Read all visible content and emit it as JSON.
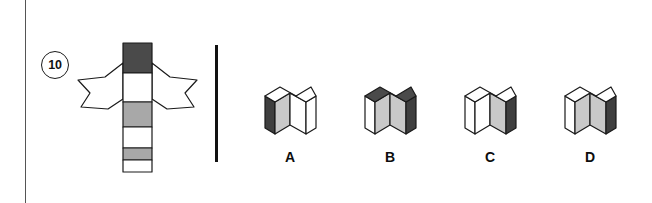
{
  "question": {
    "number": "10",
    "type": "cube-net-folding"
  },
  "colors": {
    "dark": "#4a4a4a",
    "mid_gray": "#a8a8a8",
    "light_gray": "#c9c9c9",
    "white": "#ffffff",
    "stroke": "#1a1a1a",
    "divider": "#111111",
    "edge_rule": "#555555"
  },
  "net": {
    "description": "Cross-shaped cube net: vertical strip of six squares with two arrow-shaped wings at the second row",
    "column_cells": [
      {
        "index": 1,
        "fill": "dark"
      },
      {
        "index": 2,
        "fill": "white"
      },
      {
        "index": 3,
        "fill": "mid_gray"
      },
      {
        "index": 4,
        "fill": "white"
      },
      {
        "index": 5,
        "fill": "mid_gray"
      },
      {
        "index": 6,
        "fill": "white"
      }
    ],
    "wings": [
      {
        "side": "left",
        "fill": "white"
      },
      {
        "side": "right",
        "fill": "white"
      }
    ]
  },
  "options": [
    {
      "id": "A",
      "label": "A",
      "faces": {
        "top": "white",
        "left": "dark",
        "front_left": "light_gray",
        "front_right": "white",
        "right": "white"
      }
    },
    {
      "id": "B",
      "label": "B",
      "faces": {
        "top": "dark",
        "left": "white",
        "front_left": "light_gray",
        "front_right": "light_gray",
        "right": "dark"
      }
    },
    {
      "id": "C",
      "label": "C",
      "faces": {
        "top": "white",
        "left": "white",
        "front_left": "white",
        "front_right": "light_gray",
        "right": "dark"
      }
    },
    {
      "id": "D",
      "label": "D",
      "faces": {
        "top": "white",
        "left": "white",
        "front_left": "light_gray",
        "front_right": "light_gray",
        "right": "dark"
      }
    }
  ],
  "divider": {
    "orientation": "vertical"
  }
}
